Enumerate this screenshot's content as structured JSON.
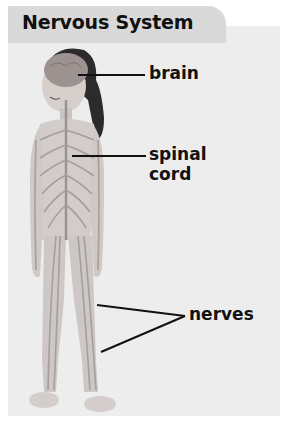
{
  "title": "Nervous System",
  "labels": {
    "brain": "brain",
    "spinal_cord_line1": "spinal",
    "spinal_cord_line2": "cord",
    "nerves": "nerves"
  },
  "colors": {
    "title_tab": "#d9d9d9",
    "panel": "#ededed",
    "text": "#111111"
  }
}
